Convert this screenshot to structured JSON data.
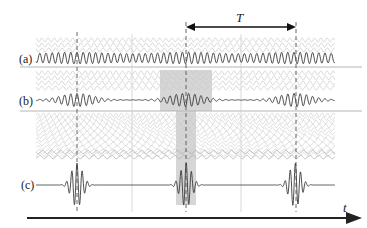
{
  "figure": {
    "type": "mode-locking pulse formation diagram",
    "period_label": "T",
    "time_axis_label": "t",
    "rows": [
      {
        "id": "a",
        "label": "(a)",
        "description": "sum of few modes - weakly modulated waveform"
      },
      {
        "id": "b",
        "label": "(b)",
        "description": "sum of more modes - wave packets"
      },
      {
        "id": "c",
        "label": "(c)",
        "description": "sum of many modes - short pulses"
      }
    ],
    "pulse_positions_px": [
      77,
      186,
      296
    ],
    "midpoint_lines_px": [
      132,
      241
    ],
    "colors": {
      "waveform": "#3a3a3a",
      "background_waves": "#c8c8c8",
      "separator": "#b0b0b0",
      "shading": "#d4d4d4",
      "axis": "#222222"
    }
  }
}
